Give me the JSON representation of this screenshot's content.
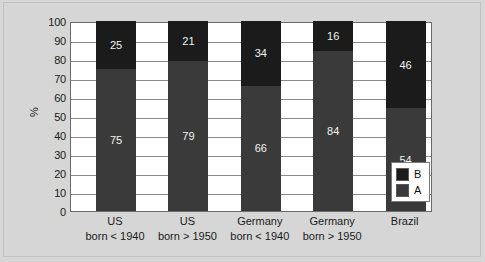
{
  "chart_data": {
    "type": "bar",
    "subtype": "stacked-bar-100-percent",
    "title": "",
    "xlabel": "",
    "ylabel": "%",
    "ylim": [
      0,
      100
    ],
    "ytick_step": 10,
    "yticks": [
      100,
      90,
      80,
      70,
      60,
      50,
      40,
      30,
      20,
      10,
      0
    ],
    "grid": true,
    "grid_axis": "y",
    "legend_position": "bottom-right-inside",
    "categories": [
      "US born < 1940",
      "US born > 1950",
      "Germany born < 1940",
      "Germany born > 1950",
      "Brazil"
    ],
    "category_lines": [
      {
        "line1": "US",
        "line2": "born < 1940"
      },
      {
        "line1": "US",
        "line2": "born > 1950"
      },
      {
        "line1": "Germany",
        "line2": "born < 1940"
      },
      {
        "line1": "Germany",
        "line2": "born > 1950"
      },
      {
        "line1": "Brazil",
        "line2": ""
      }
    ],
    "series": [
      {
        "name": "A",
        "color": "#3a3a3a",
        "values": [
          75,
          79,
          66,
          84,
          54
        ]
      },
      {
        "name": "B",
        "color": "#1b1b1b",
        "values": [
          25,
          21,
          34,
          16,
          46
        ]
      }
    ]
  },
  "axis": {
    "y_title": "%",
    "y_tick_labels": [
      "100",
      "90",
      "80",
      "70",
      "60",
      "50",
      "40",
      "30",
      "20",
      "10",
      "0"
    ]
  },
  "legend": {
    "items": [
      {
        "label": "B",
        "color": "#1b1b1b"
      },
      {
        "label": "A",
        "color": "#3a3a3a"
      }
    ]
  },
  "colors": {
    "background": "#d6d6d6",
    "plot_background": "#ffffff",
    "axis_line": "#6b6b6b",
    "gridline": "#8a8a8a",
    "series_a": "#3a3a3a",
    "series_b": "#1b1b1b",
    "label_text": "#f2f2f2"
  }
}
